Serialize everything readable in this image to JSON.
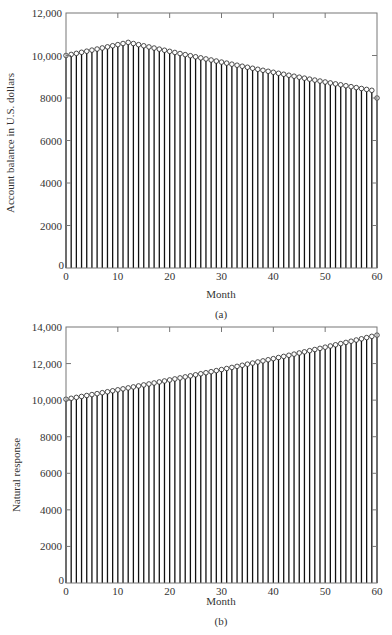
{
  "chart_data": [
    {
      "type": "stem",
      "panel": "a",
      "caption": "(a)",
      "title": "",
      "xlabel": "Month",
      "ylabel": "Account balance in U.S. dollars",
      "xlim": [
        0,
        60
      ],
      "ylim": [
        0,
        12000
      ],
      "xticks": [
        0,
        10,
        20,
        30,
        40,
        50,
        60
      ],
      "yticks": [
        0,
        2000,
        4000,
        6000,
        8000,
        10000,
        12000
      ],
      "ytick_labels": [
        "0",
        "2000",
        "4000",
        "6000",
        "8000",
        "10,000",
        "12,000"
      ],
      "grid": false,
      "x": [
        0,
        1,
        2,
        3,
        4,
        5,
        6,
        7,
        8,
        9,
        10,
        11,
        12,
        13,
        14,
        15,
        16,
        17,
        18,
        19,
        20,
        21,
        22,
        23,
        24,
        25,
        26,
        27,
        28,
        29,
        30,
        31,
        32,
        33,
        34,
        35,
        36,
        37,
        38,
        39,
        40,
        41,
        42,
        43,
        44,
        45,
        46,
        47,
        48,
        49,
        50,
        51,
        52,
        53,
        54,
        55,
        56,
        57,
        58,
        59,
        60
      ],
      "values": [
        10000,
        10050,
        10100,
        10151,
        10202,
        10253,
        10304,
        10355,
        10407,
        10459,
        10511,
        10564,
        10617,
        10563,
        10510,
        10457,
        10404,
        10351,
        10299,
        10247,
        10195,
        10143,
        10092,
        10041,
        9990,
        9939,
        9889,
        9839,
        9789,
        9739,
        9690,
        9641,
        9592,
        9543,
        9495,
        9447,
        9399,
        9351,
        9304,
        9257,
        9210,
        9163,
        9117,
        9071,
        9025,
        8979,
        8933,
        8888,
        8843,
        8798,
        8753,
        8709,
        8665,
        8621,
        8577,
        8533,
        8490,
        8447,
        8404,
        8361,
        8000
      ]
    },
    {
      "type": "stem",
      "panel": "b",
      "caption": "(b)",
      "title": "",
      "xlabel": "Month",
      "ylabel": "Natural response",
      "xlim": [
        0,
        60
      ],
      "ylim": [
        0,
        14000
      ],
      "xticks": [
        0,
        10,
        20,
        30,
        40,
        50,
        60
      ],
      "yticks": [
        0,
        2000,
        4000,
        6000,
        8000,
        10000,
        12000,
        14000
      ],
      "ytick_labels": [
        "0",
        "2000",
        "4000",
        "6000",
        "8000",
        "10,000",
        "12,000",
        "14,000"
      ],
      "grid": false,
      "x": [
        0,
        1,
        2,
        3,
        4,
        5,
        6,
        7,
        8,
        9,
        10,
        11,
        12,
        13,
        14,
        15,
        16,
        17,
        18,
        19,
        20,
        21,
        22,
        23,
        24,
        25,
        26,
        27,
        28,
        29,
        30,
        31,
        32,
        33,
        34,
        35,
        36,
        37,
        38,
        39,
        40,
        41,
        42,
        43,
        44,
        45,
        46,
        47,
        48,
        49,
        50,
        51,
        52,
        53,
        54,
        55,
        56,
        57,
        58,
        59,
        60
      ],
      "values": [
        10050,
        10100,
        10151,
        10202,
        10253,
        10304,
        10355,
        10407,
        10459,
        10511,
        10564,
        10617,
        10670,
        10723,
        10777,
        10831,
        10885,
        10939,
        10994,
        11049,
        11104,
        11160,
        11216,
        11272,
        11328,
        11385,
        11442,
        11499,
        11556,
        11614,
        11672,
        11730,
        11789,
        11848,
        11907,
        11967,
        12027,
        12087,
        12147,
        12208,
        12269,
        12330,
        12392,
        12454,
        12516,
        12579,
        12642,
        12705,
        12768,
        12832,
        12896,
        12961,
        13026,
        13091,
        13156,
        13222,
        13288,
        13354,
        13421,
        13488,
        13556
      ]
    }
  ],
  "panels": {
    "a": {
      "caption": "(a)",
      "xlabel": "Month",
      "ylabel": "Account balance in U.S. dollars"
    },
    "b": {
      "caption": "(b)",
      "xlabel": "Month",
      "ylabel": "Natural response"
    }
  }
}
